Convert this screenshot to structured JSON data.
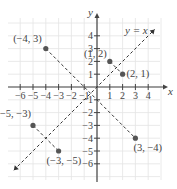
{
  "chart_data": {
    "type": "scatter",
    "title": "",
    "xlabel": "x",
    "ylabel": "y",
    "xlim": [
      -6.5,
      5
    ],
    "ylim": [
      -7,
      6
    ],
    "grid": true,
    "x_ticks": [
      -6,
      -5,
      -4,
      -3,
      -2,
      -1,
      1,
      2,
      3,
      4
    ],
    "y_ticks": [
      4,
      3,
      2,
      1,
      -1,
      -2,
      -3,
      -4,
      -5,
      -6
    ],
    "points": [
      {
        "x": -4,
        "y": 3,
        "label": "(−4, 3)"
      },
      {
        "x": 1,
        "y": 2,
        "label": "(1, 2)"
      },
      {
        "x": 2,
        "y": 1,
        "label": "(2, 1)"
      },
      {
        "x": -5,
        "y": -3,
        "label": "(−5, −3)"
      },
      {
        "x": -3,
        "y": -5,
        "label": "(−3, −5)"
      },
      {
        "x": 3,
        "y": -4,
        "label": "(3, −4)"
      }
    ],
    "lines": [
      {
        "name": "y = x",
        "label": "y = x",
        "style": "dashed",
        "from": [
          -6.5,
          -6.5
        ],
        "to": [
          4.5,
          4.5
        ]
      },
      {
        "name": "segment (−4,3)-(3,−4)",
        "style": "dashed",
        "from": [
          -4,
          3
        ],
        "to": [
          3,
          -4
        ]
      },
      {
        "name": "segment (−5,−3)-(−3,−5)",
        "style": "dashed",
        "from": [
          -5,
          -3
        ],
        "to": [
          -3,
          -5
        ]
      },
      {
        "name": "segment (1,2)-(2,1)",
        "style": "dashed",
        "from": [
          1,
          2
        ],
        "to": [
          2,
          1
        ]
      }
    ],
    "annotations": [
      "y = x"
    ]
  },
  "labels": {
    "x_axis": "x",
    "y_axis": "y",
    "line_label": "y = x"
  },
  "colors": {
    "axis": "#444444",
    "grid": "#e4e4e4",
    "point": "#555555",
    "text": "#555555"
  }
}
